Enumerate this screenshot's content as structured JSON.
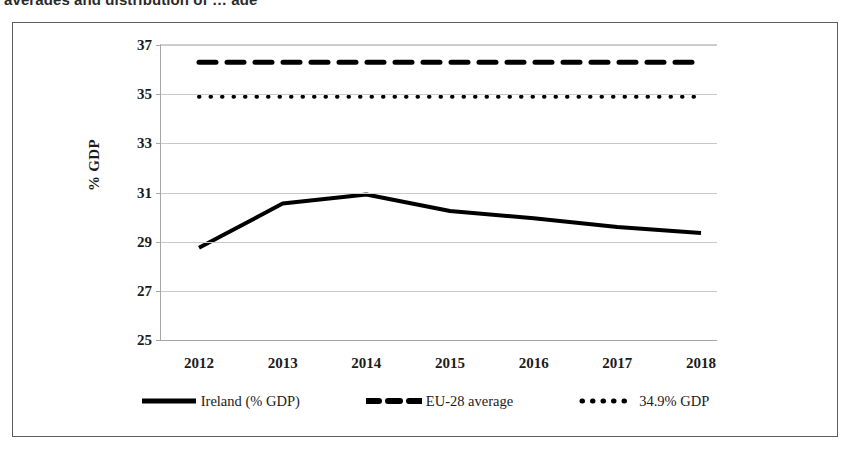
{
  "caption": {
    "clipped_text": "averages and distribution of … age"
  },
  "chart_data": {
    "type": "line",
    "title": "",
    "subtitle": "",
    "xlabel": "",
    "ylabel": "% GDP",
    "x": [
      "2012",
      "2013",
      "2014",
      "2015",
      "2016",
      "2017",
      "2018"
    ],
    "xlim": [
      2012,
      2018
    ],
    "ylim": [
      25,
      37
    ],
    "yticks": [
      25,
      27,
      29,
      31,
      33,
      35,
      37
    ],
    "ytick_labels": [
      "25",
      "27",
      "29",
      "31",
      "33",
      "35",
      "37"
    ],
    "grid": true,
    "grid_axis": "y",
    "legend_position": "bottom",
    "series": [
      {
        "name": "Ireland (% GDP)",
        "style": "solid",
        "color": "#000000",
        "width": 4,
        "values": [
          28.75,
          30.55,
          30.92,
          30.25,
          29.95,
          29.6,
          29.35
        ]
      },
      {
        "name": "EU-28 average",
        "style": "dashed",
        "color": "#000000",
        "width": 5,
        "constant": 36.3,
        "values": [
          36.3,
          36.3,
          36.3,
          36.3,
          36.3,
          36.3,
          36.3
        ]
      },
      {
        "name": "34.9% GDP",
        "style": "dotted",
        "color": "#000000",
        "width": 4,
        "constant": 34.9,
        "values": [
          34.9,
          34.9,
          34.9,
          34.9,
          34.9,
          34.9,
          34.9
        ]
      }
    ]
  },
  "legend": {
    "items": [
      {
        "label": "Ireland (% GDP)",
        "style": "solid"
      },
      {
        "label": "EU-28 average",
        "style": "dashed"
      },
      {
        "label": "34.9% GDP",
        "style": "dotted"
      }
    ]
  }
}
